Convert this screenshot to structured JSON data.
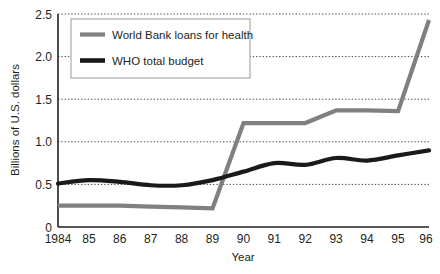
{
  "chart_data": {
    "type": "line",
    "title": "",
    "xlabel": "Year",
    "ylabel": "Billions of U.S. dollars",
    "x": [
      1984,
      1985,
      1986,
      1987,
      1988,
      1989,
      1990,
      1991,
      1992,
      1993,
      1994,
      1995,
      1996
    ],
    "xticklabels": [
      "1984",
      "85",
      "86",
      "87",
      "88",
      "89",
      "90",
      "91",
      "92",
      "93",
      "94",
      "95",
      "96"
    ],
    "yticklabels": [
      "0",
      "0.5",
      "1.0",
      "1.5",
      "2.0",
      "2.5"
    ],
    "ytickvalues": [
      0,
      0.5,
      1.0,
      1.5,
      2.0,
      2.5
    ],
    "ylim": [
      0,
      2.5
    ],
    "xlim": [
      1984,
      1996
    ],
    "grid": "horizontal-dotted",
    "legend_position": "top-left-inside",
    "series": [
      {
        "name": "World Bank loans for health",
        "color": "#808080",
        "style": "step-linear",
        "values": [
          0.25,
          0.25,
          0.25,
          0.24,
          0.23,
          0.22,
          1.22,
          1.22,
          1.22,
          1.37,
          1.37,
          1.36,
          2.43
        ]
      },
      {
        "name": "WHO total budget",
        "color": "#1a1a1a",
        "style": "smooth",
        "values": [
          0.51,
          0.55,
          0.53,
          0.49,
          0.49,
          0.55,
          0.65,
          0.75,
          0.73,
          0.81,
          0.78,
          0.84,
          0.9
        ]
      }
    ]
  },
  "legend": {
    "items": [
      {
        "label": "World Bank loans for health",
        "color": "#808080"
      },
      {
        "label": "WHO total budget",
        "color": "#1a1a1a"
      }
    ]
  },
  "axes": {
    "y_title": "Billions of U.S. dollars",
    "x_title": "Year",
    "y_ticks": [
      "2.5",
      "2.0",
      "1.5",
      "1.0",
      "0.5",
      "0"
    ],
    "x_ticks": [
      "1984",
      "85",
      "86",
      "87",
      "88",
      "89",
      "90",
      "91",
      "92",
      "93",
      "94",
      "95",
      "96"
    ]
  },
  "colors": {
    "world_bank_gray": "#808080",
    "who_black": "#1a1a1a",
    "axis": "#231f20",
    "gridline": "#4d4d4d",
    "background": "#ffffff"
  }
}
